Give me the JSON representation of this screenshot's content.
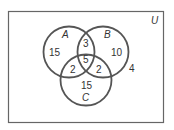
{
  "diagram": {
    "type": "venn-3",
    "universe_label": "U",
    "sets": [
      {
        "name": "A",
        "only": "15"
      },
      {
        "name": "B",
        "only": "10"
      },
      {
        "name": "C",
        "only": "15"
      }
    ],
    "regions": {
      "A_only": "15",
      "B_only": "10",
      "C_only": "15",
      "A_and_B_only": "3",
      "A_and_C_only": "2",
      "B_and_C_only": "2",
      "A_and_B_and_C": "5",
      "outside": "4"
    },
    "colors": {
      "stroke": "#555555",
      "text": "#333333",
      "background": "#ffffff"
    }
  }
}
